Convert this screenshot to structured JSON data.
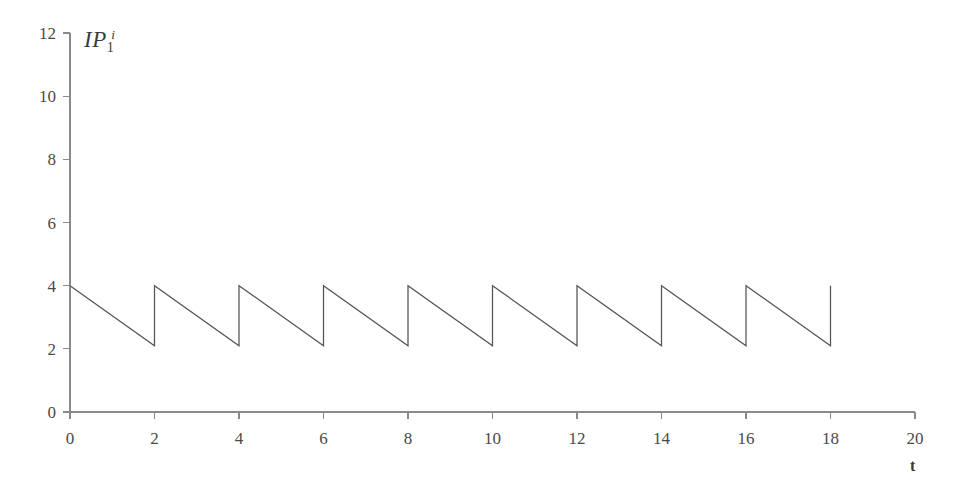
{
  "chart_data": {
    "type": "line",
    "title": "",
    "subtitle": "",
    "series_label": "IP",
    "series_label_sub": "1",
    "series_label_sup": "i",
    "xlabel": "t",
    "ylabel": "",
    "xlim": [
      0,
      20
    ],
    "ylim": [
      0,
      12
    ],
    "xticks": [
      0,
      2,
      4,
      6,
      8,
      10,
      12,
      14,
      16,
      18,
      20
    ],
    "yticks": [
      0,
      2,
      4,
      6,
      8,
      10,
      12
    ],
    "xtick_labels": [
      "0",
      "2",
      "4",
      "6",
      "8",
      "10",
      "12",
      "14",
      "16",
      "18",
      "20"
    ],
    "ytick_labels": [
      "0",
      "2",
      "4",
      "6",
      "8",
      "10",
      "12"
    ],
    "grid": false,
    "legend": false,
    "legend_position": "none",
    "waveform": "sawtooth",
    "peak_value": 4,
    "trough_value": 2.1,
    "period": 2,
    "cycles": 9,
    "data_end_x": 18,
    "annotations": [],
    "x": [
      0,
      2,
      2,
      4,
      4,
      6,
      6,
      8,
      8,
      10,
      10,
      12,
      12,
      14,
      14,
      16,
      16,
      18,
      18
    ],
    "y": [
      4,
      2.1,
      4,
      2.1,
      4,
      2.1,
      4,
      2.1,
      4,
      2.1,
      4,
      2.1,
      4,
      2.1,
      4,
      2.1,
      4,
      2.1,
      4
    ],
    "line_color": "#555555",
    "axis_color": "#8a8a8a",
    "background_color": "#ffffff"
  }
}
